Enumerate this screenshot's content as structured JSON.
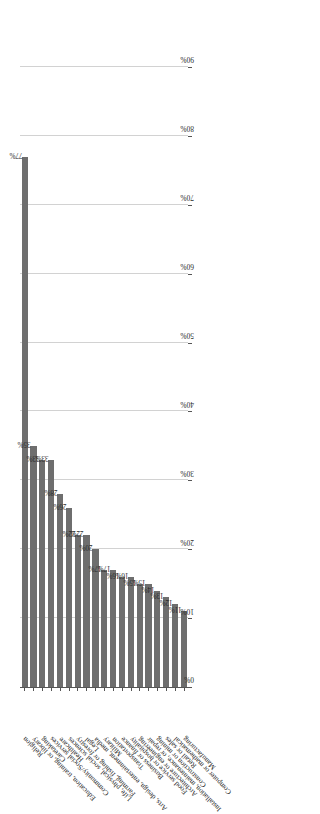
{
  "chart_data": {
    "type": "bar",
    "orientation": "horizontal",
    "title": "",
    "subtitle": "",
    "xlabel": "",
    "ylabel": "",
    "xlim": [
      0,
      90
    ],
    "xtick_labels": [
      "0%",
      "10%",
      "20%",
      "30%",
      "40%",
      "50%",
      "60%",
      "70%",
      "80%",
      "90%"
    ],
    "xtick_values": [
      0,
      10,
      20,
      30,
      40,
      50,
      60,
      70,
      80,
      90
    ],
    "grid": "vertical",
    "legend": "none",
    "value_suffix": "%",
    "bar_color": "#6e6e6e",
    "gridline_color": "#d2d2d2",
    "axis_color": "#555555",
    "categories": [
      "Religion",
      "Education, training, or library",
      "Caretaking",
      "Community/Social services",
      "Healthcare",
      "Life, physical, social sciences",
      "Farming, fishing or forestry",
      "Legal",
      "Arts, design, entertainment, media",
      "Military",
      "Transportation",
      "Business or finance",
      "Food service or hospitality",
      "Architecture or engineering",
      "Installation, maintenance, or repair",
      "Construction or mining",
      "Retail or sales",
      "Computer or mathematical",
      "Manufacturing"
    ],
    "values": [
      77,
      35,
      33,
      33,
      28,
      26,
      22,
      22,
      20,
      17,
      17,
      16,
      16,
      15,
      15,
      14,
      13,
      12,
      11
    ],
    "data_labels": [
      "77%",
      "35%",
      "33%",
      "33%",
      "28%",
      "26%",
      "22%",
      "22%",
      "20%",
      "17%",
      "17%",
      "16%",
      "16%",
      "15%",
      "15%",
      "14%",
      "13%",
      "12%",
      "11%"
    ]
  }
}
